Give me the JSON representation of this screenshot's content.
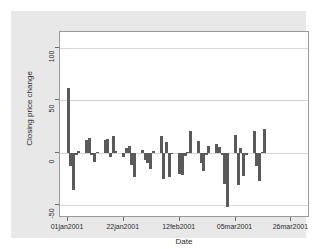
{
  "chart_data": {
    "type": "bar",
    "title": "",
    "subtitle": "",
    "xlabel": "Date",
    "ylabel": "Closing price change",
    "ylim": [
      -62,
      115
    ],
    "yticks": [
      -50,
      0,
      50,
      100
    ],
    "ytick_labels": [
      "-50",
      "0",
      "50",
      "100"
    ],
    "xtick_labels": [
      "01jan2001",
      "22jan2001",
      "12feb2001",
      "05mar2001",
      "26mar2001"
    ],
    "xtick_positions": [
      1,
      22,
      43,
      64,
      85
    ],
    "xlim": [
      -2,
      92
    ],
    "grid": "horizontal",
    "legend": "none",
    "bar_color": "#5a5a5a",
    "plot_bgcolor": "#ffffff",
    "graph_bgcolor": "#e8e8e8",
    "series_name": "Closing price change",
    "x": [
      1,
      2,
      3,
      4,
      5,
      8,
      9,
      10,
      11,
      12,
      15,
      16,
      17,
      18,
      19,
      22,
      23,
      24,
      25,
      26,
      29,
      30,
      31,
      32,
      33,
      36,
      37,
      38,
      39,
      40,
      43,
      44,
      45,
      46,
      47,
      50,
      51,
      52,
      53,
      54,
      57,
      58,
      59,
      60,
      61,
      64,
      65,
      66,
      67,
      68,
      71,
      72,
      73,
      74,
      75,
      78,
      79,
      80,
      81,
      82,
      85,
      86
    ],
    "values": [
      62,
      -13,
      -35,
      -2,
      2,
      12,
      14,
      -2,
      -9,
      1,
      12,
      13,
      -4,
      16,
      2,
      -4,
      5,
      7,
      -12,
      -23,
      3,
      -7,
      -10,
      -15,
      2,
      16,
      -25,
      10,
      -23,
      -1,
      -20,
      -21,
      -3,
      1,
      21,
      11,
      -10,
      -17,
      -2,
      7,
      8,
      6,
      -2,
      -30,
      -52,
      17,
      -31,
      5,
      -22,
      -2,
      21,
      -13,
      -27,
      1,
      23,
      0,
      0,
      0,
      0,
      0,
      0,
      0
    ]
  },
  "axes": {
    "y_title": "Closing price change",
    "x_title": "Date"
  }
}
